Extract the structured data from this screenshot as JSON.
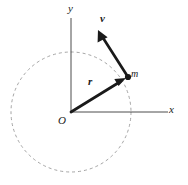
{
  "figure": {
    "type": "physics-vector-diagram",
    "background_color": "#ffffff",
    "stroke_color": "#1a1a1a",
    "axis_color": "#4d4d4d",
    "circle_color": "#9a9a9a"
  },
  "axes": {
    "x": {
      "label": "x",
      "start": {
        "x": 71,
        "y": 112
      },
      "end": {
        "x": 168,
        "y": 112
      },
      "label_pos": {
        "x": 169,
        "y": 104
      }
    },
    "y": {
      "label": "y",
      "start": {
        "x": 71,
        "y": 112
      },
      "end": {
        "x": 71,
        "y": 18
      },
      "label_pos": {
        "x": 68,
        "y": 3
      }
    },
    "origin": {
      "label": "O",
      "x": 71,
      "y": 112,
      "label_pos": {
        "x": 58,
        "y": 115
      }
    }
  },
  "circle": {
    "name": "circular-path",
    "center": {
      "x": 71,
      "y": 112
    },
    "radius": 60,
    "style": "dashed",
    "dash_pattern": "3 3",
    "color": "#9a9a9a",
    "stroke_width": 0.9
  },
  "vectors": [
    {
      "name": "position-vector",
      "label": "r",
      "from": {
        "x": 71,
        "y": 112
      },
      "to": {
        "x": 126,
        "y": 78
      },
      "label_pos": {
        "x": 88,
        "y": 76
      },
      "stroke_width": 2.6,
      "color": "#1a1a1a"
    },
    {
      "name": "velocity-vector",
      "label": "v",
      "from": {
        "x": 128,
        "y": 77
      },
      "to": {
        "x": 98,
        "y": 30
      },
      "label_pos": {
        "x": 100,
        "y": 13
      },
      "stroke_width": 2.6,
      "color": "#1a1a1a"
    }
  ],
  "particle": {
    "name": "mass-point",
    "label": "m",
    "x": 128,
    "y": 77,
    "radius": 3.1,
    "color": "#1a1a1a",
    "label_pos": {
      "x": 131,
      "y": 69
    }
  }
}
